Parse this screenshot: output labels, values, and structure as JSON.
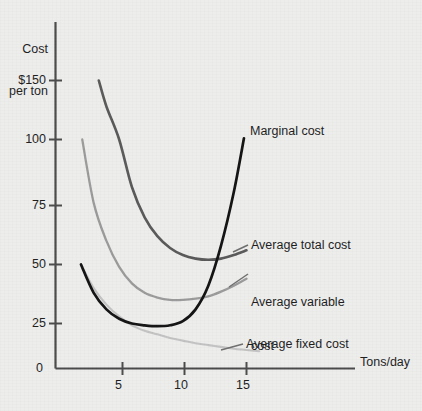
{
  "figure": {
    "background_color": "#ededec",
    "axis_color": "#4a4a4a",
    "text_color": "#1c1c1c"
  },
  "axes": {
    "y_title_line1": "Cost",
    "y_title_line2": "per ton",
    "x_title": "Tons/day",
    "origin_label": "0",
    "y_ticks": [
      "$150",
      "100",
      "75",
      "50",
      "25"
    ],
    "x_ticks": [
      "5",
      "10",
      "15"
    ]
  },
  "labels": {
    "marginal_cost": "Marginal cost",
    "average_total_cost": "Average total cost",
    "average_variable_cost_line1": "Average variable",
    "average_variable_cost_line2": "cost",
    "average_fixed_cost": "Average fixed cost"
  },
  "chart_data": {
    "type": "line",
    "title": "",
    "xlabel": "Tons/day",
    "ylabel": "Cost per ton",
    "xlim": [
      0,
      17
    ],
    "ylim": [
      0,
      160
    ],
    "grid": false,
    "legend": "inline-annotations",
    "x_ticks": [
      5,
      10,
      15
    ],
    "y_ticks": [
      25,
      50,
      75,
      100,
      150
    ],
    "y_axis_note": "non-linear spacing between 100 and 150",
    "colors": {
      "marginal_cost": "#111111",
      "average_total_cost": "#585858",
      "average_variable_cost": "#9a9a9a",
      "average_fixed_cost": "#c2c2c2"
    },
    "series": [
      {
        "name": "Marginal cost",
        "color": "#111111",
        "points": [
          [
            2.0,
            50
          ],
          [
            3.0,
            38
          ],
          [
            4.0,
            31
          ],
          [
            5.0,
            27
          ],
          [
            6.0,
            25
          ],
          [
            7.0,
            24
          ],
          [
            8.0,
            23.5
          ],
          [
            9.0,
            24
          ],
          [
            10.0,
            26
          ],
          [
            11.0,
            31
          ],
          [
            12.0,
            41
          ],
          [
            13.0,
            58
          ],
          [
            14.0,
            80
          ],
          [
            14.8,
            101
          ]
        ]
      },
      {
        "name": "Average total cost",
        "color": "#585858",
        "points": [
          [
            3.4,
            150
          ],
          [
            4.0,
            128
          ],
          [
            5.0,
            100
          ],
          [
            6.0,
            82
          ],
          [
            7.0,
            70
          ],
          [
            8.0,
            62
          ],
          [
            9.0,
            57
          ],
          [
            10.0,
            54
          ],
          [
            11.0,
            52.5
          ],
          [
            12.0,
            52
          ],
          [
            13.0,
            52.5
          ],
          [
            14.0,
            54
          ],
          [
            15.0,
            56
          ]
        ]
      },
      {
        "name": "Average variable cost",
        "color": "#9a9a9a",
        "points": [
          [
            2.1,
            100
          ],
          [
            3.0,
            76
          ],
          [
            4.0,
            60
          ],
          [
            5.0,
            49
          ],
          [
            6.0,
            42
          ],
          [
            7.0,
            38
          ],
          [
            8.0,
            36
          ],
          [
            9.0,
            35
          ],
          [
            10.0,
            35
          ],
          [
            11.0,
            35.5
          ],
          [
            12.0,
            36.5
          ],
          [
            13.0,
            38.5
          ],
          [
            14.0,
            41
          ],
          [
            15.0,
            44
          ]
        ]
      },
      {
        "name": "Average fixed cost",
        "color": "#c2c2c2",
        "points": [
          [
            2.0,
            50
          ],
          [
            3.0,
            40
          ],
          [
            4.0,
            33
          ],
          [
            5.0,
            28
          ],
          [
            6.0,
            24
          ],
          [
            7.0,
            21
          ],
          [
            8.0,
            19
          ],
          [
            9.0,
            17
          ],
          [
            10.0,
            15.5
          ],
          [
            11.0,
            14
          ],
          [
            12.0,
            13
          ],
          [
            13.0,
            12
          ],
          [
            14.0,
            11
          ],
          [
            15.0,
            10.3
          ],
          [
            16.0,
            9.6
          ]
        ]
      }
    ]
  }
}
